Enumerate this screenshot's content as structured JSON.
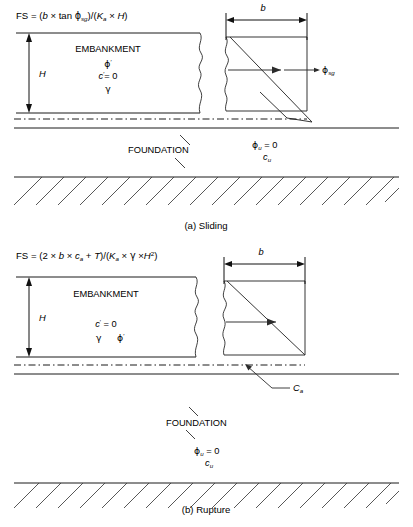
{
  "figure": {
    "background": "#ffffff",
    "line_color": "#1a1a1a"
  },
  "panels": [
    {
      "id": "panel-a",
      "caption": "(a) Sliding",
      "formula": {
        "full": "FS = (b × tan ϕsg)/(Ka × H)",
        "parts": [
          {
            "text": "FS = (",
            "style": "roman"
          },
          {
            "text": "b",
            "style": "italic"
          },
          {
            "text": " × tan ",
            "style": "roman"
          },
          {
            "text": "ϕ",
            "style": "greek"
          },
          {
            "text": "sg",
            "style": "subscript"
          },
          {
            "text": ")/(",
            "style": "roman"
          },
          {
            "text": "K",
            "style": "italic"
          },
          {
            "text": "a",
            "style": "subscript"
          },
          {
            "text": " × ",
            "style": "roman"
          },
          {
            "text": "H",
            "style": "italic"
          },
          {
            "text": ")",
            "style": "roman"
          }
        ]
      },
      "embankment_label": "EMBANKMENT",
      "embankment_props": [
        {
          "symbol": "ϕ",
          "mark": "′",
          "value": ""
        },
        {
          "symbol": "c",
          "mark": "′",
          "value": "= 0"
        },
        {
          "symbol": "γ",
          "mark": "",
          "value": ""
        }
      ],
      "height_label": "H",
      "width_label": "b",
      "interface_angle_label": {
        "symbol": "ϕ",
        "sub": "sg"
      },
      "foundation_label": "FOUNDATION",
      "foundation_props": [
        {
          "symbol": "ϕ",
          "sub": "u",
          "value": "= 0"
        },
        {
          "symbol": "c",
          "sub": "u",
          "value": ""
        }
      ]
    },
    {
      "id": "panel-b",
      "caption": "(b) Rupture",
      "formula": {
        "full": "FS = (2 × b × ca + T)/(Ka × γ ×H2)",
        "parts": [
          {
            "text": "FS = (2 × ",
            "style": "roman"
          },
          {
            "text": "b",
            "style": "italic"
          },
          {
            "text": " × ",
            "style": "roman"
          },
          {
            "text": "c",
            "style": "italic"
          },
          {
            "text": "a",
            "style": "subscript"
          },
          {
            "text": " + ",
            "style": "roman"
          },
          {
            "text": "T",
            "style": "italic"
          },
          {
            "text": ")/(",
            "style": "roman"
          },
          {
            "text": "K",
            "style": "italic"
          },
          {
            "text": "a",
            "style": "subscript"
          },
          {
            "text": " × ",
            "style": "roman"
          },
          {
            "text": "γ",
            "style": "greek"
          },
          {
            "text": " ×",
            "style": "roman"
          },
          {
            "text": "H",
            "style": "italic"
          },
          {
            "text": "2",
            "style": "superscript"
          },
          {
            "text": ")",
            "style": "roman"
          }
        ]
      },
      "embankment_label": "EMBANKMENT",
      "embankment_props": [
        {
          "symbol": "c",
          "mark": "′",
          "value": "= 0"
        },
        {
          "symbol": "γ",
          "mark": "",
          "value": ""
        },
        {
          "symbol": "ϕ",
          "mark": "′",
          "value": ""
        }
      ],
      "height_label": "H",
      "width_label": "b",
      "adhesion_label": {
        "symbol": "C",
        "sub": "a"
      },
      "foundation_label": "FOUNDATION",
      "foundation_props": [
        {
          "symbol": "ϕ",
          "sub": "u",
          "value": "= 0"
        },
        {
          "symbol": "c",
          "sub": "u",
          "value": ""
        }
      ]
    }
  ],
  "glyphs": {
    "phi": "ϕ",
    "gamma": "γ",
    "prime": "′",
    "times": "×"
  }
}
